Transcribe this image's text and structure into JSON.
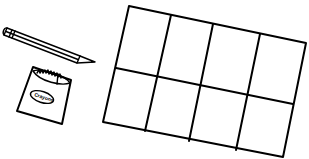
{
  "illustration": {
    "description": "Line drawing of a pencil, a crayon box and a 2x4 grid",
    "pencil": {
      "icon": "pencil-icon"
    },
    "crayon_box": {
      "icon": "crayon-box-icon",
      "label": "Crayons"
    },
    "grid": {
      "rows": 2,
      "columns": 4,
      "cells": 8
    },
    "colors": {
      "line": "#000000",
      "background": "#ffffff"
    }
  }
}
